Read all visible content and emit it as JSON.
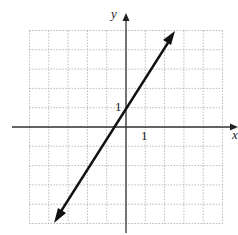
{
  "chart_data": {
    "type": "line",
    "title": "",
    "xlabel": "x",
    "ylabel": "y",
    "xlim": [
      -5,
      5
    ],
    "ylim": [
      -5,
      5
    ],
    "grid": true,
    "tick_labels": {
      "x": [
        "1"
      ],
      "y": [
        "1"
      ]
    },
    "series": [
      {
        "name": "line",
        "equation": "y = 1.5x + 1",
        "x": [
          -3.8,
          2.6
        ],
        "y": [
          -4.7,
          4.9
        ],
        "arrows": "both"
      }
    ]
  },
  "labels": {
    "x_axis": "x",
    "y_axis": "y",
    "x_tick": "1",
    "y_tick": "1"
  }
}
